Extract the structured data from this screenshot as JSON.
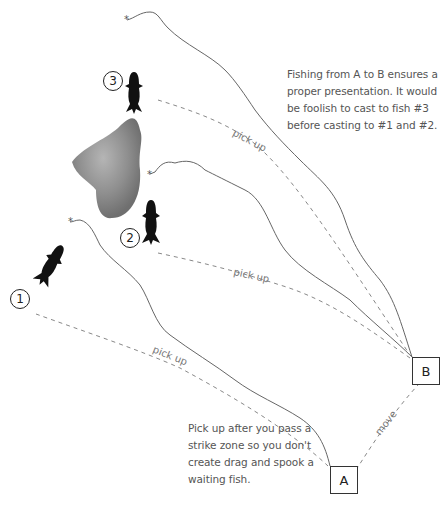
{
  "diagram": {
    "notes": {
      "top": "Fishing from A to B ensures a proper presentation. It would be foolish to cast to fish #3 before casting to #1 and #2.",
      "bottom": "Pick up after you pass a strike zone so you don't create drag and spook a waiting fish."
    },
    "stations": {
      "a": "A",
      "b": "B"
    },
    "fish_labels": {
      "fish1": "1",
      "fish2": "2",
      "fish3": "3"
    },
    "path_labels": {
      "pickup1": "pick up",
      "pickup2": "pick up",
      "pickup3": "pick up",
      "move": "move"
    },
    "colors": {
      "line": "#666666",
      "dashed": "#888888",
      "fish": "#111111",
      "rock": "#8a8a8a"
    }
  }
}
